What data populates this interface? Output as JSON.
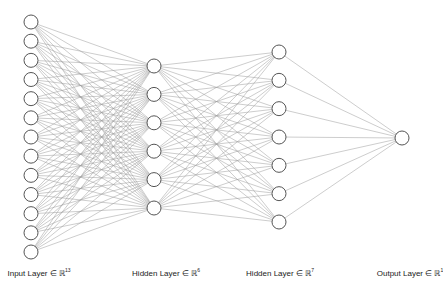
{
  "diagram": {
    "type": "neural-network",
    "colors": {
      "node_stroke": "#555555",
      "node_fill": "#ffffff",
      "edge": "#9a9a9a",
      "text": "#222222"
    },
    "layers": [
      {
        "name": "Input Layer ∈ ℝ",
        "dim": "13",
        "nodes": 13,
        "x": 31,
        "y_start": 22,
        "y_end": 252
      },
      {
        "name": "Hidden Layer ∈ ℝ",
        "dim": "6",
        "nodes": 6,
        "x": 154,
        "y_start": 66,
        "y_end": 208
      },
      {
        "name": "Hidden Layer ∈ ℝ",
        "dim": "7",
        "nodes": 7,
        "x": 279,
        "y_start": 52,
        "y_end": 222
      },
      {
        "name": "Output Layer ∈ ℝ",
        "dim": "1",
        "nodes": 1,
        "x": 402,
        "y_start": 138,
        "y_end": 138
      }
    ],
    "label_x": [
      39,
      166,
      280,
      410
    ],
    "node_radius": 7
  }
}
